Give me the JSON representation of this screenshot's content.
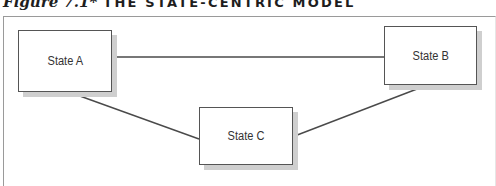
{
  "figure": {
    "label": "Figure 7.1*",
    "title": "THE STATE-CENTRIC MODEL"
  },
  "diagram": {
    "nodes": [
      {
        "id": "A",
        "label": "State A"
      },
      {
        "id": "B",
        "label": "State B"
      },
      {
        "id": "C",
        "label": "State C"
      }
    ],
    "edges": [
      {
        "from": "A",
        "to": "B"
      },
      {
        "from": "A",
        "to": "C"
      },
      {
        "from": "B",
        "to": "C"
      }
    ]
  },
  "colors": {
    "box_border": "#555555",
    "box_shadow": "#cfcfcf",
    "edge": "#4a4a4a",
    "frame": "#9a9a9a"
  }
}
